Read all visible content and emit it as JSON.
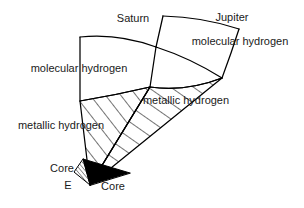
{
  "figure": {
    "type": "diagram",
    "width": 304,
    "height": 208,
    "background_color": "#ffffff",
    "stroke_color": "#000000",
    "text_color": "#1a1a1a",
    "core_fill_jupiter": "#000000",
    "core_fill_saturn": "#ffffff",
    "hatch_pattern": "diagonal-lines"
  },
  "labels": {
    "saturn_title": "Saturn",
    "jupiter_title": "Jupiter",
    "saturn_molecular": "molecular hydrogen",
    "saturn_metallic": "metallic hydrogen",
    "jupiter_molecular": "molecular hydrogen",
    "jupiter_metallic": "metallic hydrogen",
    "saturn_core": "Core",
    "jupiter_core": "Core",
    "earth_marker": "E"
  },
  "label_positions": {
    "saturn_title": {
      "x": 133,
      "y": 18
    },
    "jupiter_title": {
      "x": 232,
      "y": 17
    },
    "saturn_molecular": {
      "x": 79,
      "y": 68
    },
    "saturn_metallic": {
      "x": 61,
      "y": 125
    },
    "jupiter_molecular": {
      "x": 240,
      "y": 41
    },
    "jupiter_metallic": {
      "x": 186,
      "y": 100
    },
    "saturn_core": {
      "x": 62,
      "y": 168
    },
    "jupiter_core": {
      "x": 113,
      "y": 186
    },
    "earth_marker": {
      "x": 68,
      "y": 185
    }
  },
  "structure": {
    "apex": {
      "x": 90,
      "y": 185
    },
    "saturn_wedge": {
      "name": "Saturn interior wedge",
      "layers": [
        "molecular hydrogen",
        "metallic hydrogen",
        "Core"
      ],
      "left_edge_x": 80,
      "top_y": 37,
      "bottom_y": 185
    },
    "jupiter_wedge": {
      "name": "Jupiter interior wedge",
      "layers": [
        "molecular hydrogen",
        "metallic hydrogen",
        "Core"
      ],
      "top_y": 15,
      "bottom_y": 185
    }
  }
}
